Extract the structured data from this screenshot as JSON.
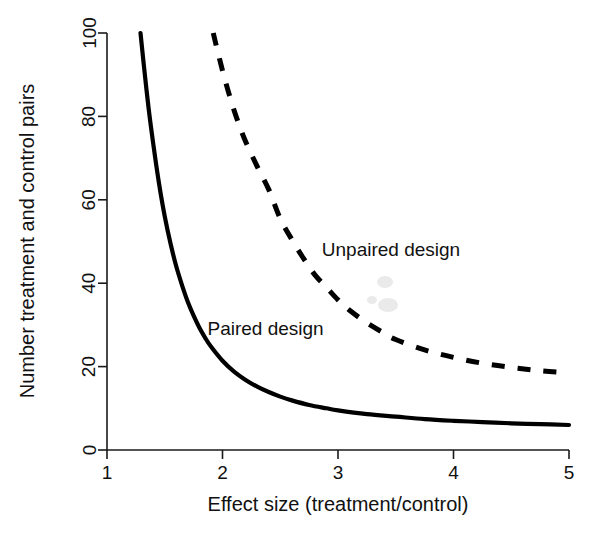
{
  "chart_data": {
    "type": "line",
    "title": "",
    "xlabel": "Effect size (treatment/control)",
    "ylabel": "Number treatment and control pairs",
    "xlim": [
      1,
      5
    ],
    "ylim": [
      0,
      100
    ],
    "xticks": [
      "1",
      "2",
      "3",
      "4",
      "5"
    ],
    "xtick_values": [
      1,
      2,
      3,
      4,
      5
    ],
    "yticks": [
      "0",
      "20",
      "40",
      "60",
      "80",
      "100"
    ],
    "ytick_values": [
      0,
      20,
      40,
      60,
      80,
      100
    ],
    "grid": false,
    "legend_position": "inline-annotations",
    "series": [
      {
        "name": "Paired design",
        "style": "solid",
        "color": "#000000",
        "label_x": 1.87,
        "label_y": 27.5,
        "x": [
          1.29,
          1.32,
          1.36,
          1.4,
          1.45,
          1.5,
          1.55,
          1.6,
          1.65,
          1.7,
          1.75,
          1.8,
          1.85,
          1.9,
          2.0,
          2.1,
          2.2,
          2.3,
          2.4,
          2.5,
          2.6,
          2.75,
          2.9,
          3.0,
          3.25,
          3.5,
          3.75,
          4.0,
          4.25,
          4.5,
          4.75,
          5.0
        ],
        "y": [
          100.0,
          92.0,
          82.0,
          73.5,
          64.0,
          56.0,
          49.5,
          44.0,
          39.5,
          35.5,
          32.2,
          29.3,
          26.9,
          24.8,
          21.4,
          18.8,
          16.8,
          15.2,
          13.9,
          12.8,
          11.9,
          10.8,
          10.0,
          9.5,
          8.6,
          8.0,
          7.4,
          7.0,
          6.7,
          6.4,
          6.2,
          6.0
        ]
      },
      {
        "name": "Unpaired design",
        "style": "dashed",
        "color": "#000000",
        "label_x": 2.86,
        "label_y": 46.5,
        "x": [
          1.92,
          1.95,
          2.0,
          2.05,
          2.1,
          2.15,
          2.2,
          2.3,
          2.4,
          2.5,
          2.6,
          2.7,
          2.8,
          2.9,
          3.0,
          3.1,
          3.25,
          3.4,
          3.5,
          3.75,
          4.0,
          4.25,
          4.5,
          4.75,
          5.0
        ],
        "y": [
          100.0,
          96.5,
          91.0,
          86.0,
          81.5,
          77.5,
          74.0,
          68.0,
          62.5,
          55.5,
          50.5,
          46.0,
          42.0,
          39.0,
          36.0,
          33.5,
          30.5,
          28.0,
          26.5,
          24.0,
          22.2,
          20.8,
          19.8,
          19.0,
          18.5
        ]
      }
    ],
    "annotations": [
      {
        "text": "Paired design",
        "x": 1.87,
        "y": 27.5
      },
      {
        "text": "Unpaired design",
        "x": 2.86,
        "y": 46.5
      }
    ]
  },
  "figure": {
    "background": "#ffffff",
    "foreground": "#000000",
    "plot_left_px": 107,
    "plot_right_px": 569,
    "plot_top_px": 33,
    "plot_bottom_px": 450
  }
}
